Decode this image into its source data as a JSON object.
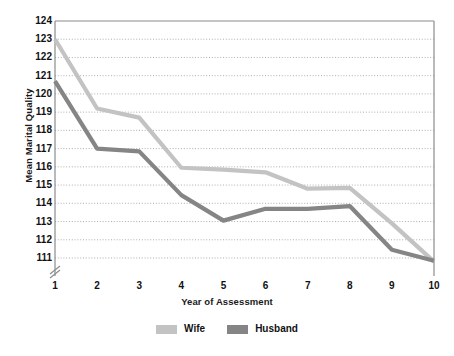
{
  "chart_data": {
    "type": "line",
    "title": "",
    "xlabel": "Year of Assessment",
    "ylabel": "Mean Marital Quality",
    "x": [
      1,
      2,
      3,
      4,
      5,
      6,
      7,
      8,
      9,
      10
    ],
    "categories": [
      "1",
      "2",
      "3",
      "4",
      "5",
      "6",
      "7",
      "8",
      "9",
      "10"
    ],
    "xlim": [
      1,
      10
    ],
    "ylim": [
      111,
      124
    ],
    "y_ticks": [
      111,
      112,
      113,
      114,
      115,
      116,
      117,
      118,
      119,
      120,
      121,
      122,
      123,
      124
    ],
    "y_tick_labels": [
      "111",
      "112",
      "113",
      "114",
      "115",
      "116",
      "117",
      "118",
      "119",
      "120",
      "121",
      "122",
      "123",
      "124"
    ],
    "x_ticks": [
      1,
      2,
      3,
      4,
      5,
      6,
      7,
      8,
      9,
      10
    ],
    "x_tick_labels": [
      "1",
      "2",
      "3",
      "4",
      "5",
      "6",
      "7",
      "8",
      "9",
      "10"
    ],
    "grid": true,
    "grid_style": "dotted-horizontal",
    "axis_break": true,
    "axis_break_note": "y-axis broken below 111",
    "legend_position": "bottom-center",
    "series": [
      {
        "name": "Wife",
        "color": "#c3c3c3",
        "values": [
          123.0,
          119.2,
          118.7,
          115.95,
          115.85,
          115.7,
          114.8,
          114.85,
          112.9,
          110.8
        ]
      },
      {
        "name": "Husband",
        "color": "#858585",
        "values": [
          120.7,
          117.0,
          116.85,
          114.45,
          113.05,
          113.7,
          113.7,
          113.85,
          111.45,
          110.85
        ]
      }
    ]
  },
  "axis_titles": {
    "x": "Year of Assessment",
    "y": "Mean Marital Quality"
  },
  "legend": {
    "items": [
      {
        "label": "Wife",
        "color": "#c3c3c3"
      },
      {
        "label": "Husband",
        "color": "#858585"
      }
    ]
  },
  "colors": {
    "wife": "#c3c3c3",
    "husband": "#858585",
    "axis": "#8c8c8c",
    "grid": "#9a9a9a",
    "text": "#111111",
    "background": "#ffffff"
  },
  "plot_geometry": {
    "left": 55,
    "right": 434,
    "top": 21,
    "bottom": 258
  }
}
